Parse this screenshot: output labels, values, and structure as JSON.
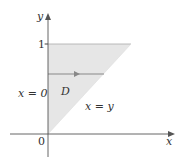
{
  "diagram": {
    "title": "",
    "colors": {
      "region_fill": "#e6e6e6",
      "axis": "#555555",
      "line": "#888888",
      "text": "#333333"
    },
    "axes": {
      "x_label": "x",
      "y_label": "y",
      "origin_label": "0",
      "y_tick_label": "1"
    },
    "region": {
      "label": "D",
      "vertices": [
        [
          0,
          0
        ],
        [
          0,
          1
        ],
        [
          1,
          1
        ]
      ]
    },
    "boundaries": {
      "left": "x = 0",
      "diagonal": "x = y"
    },
    "horizontal_arrow": {
      "description": "horizontal line segment from x=0 to x=y with arrow pointing right",
      "y_value": 0.67
    }
  }
}
